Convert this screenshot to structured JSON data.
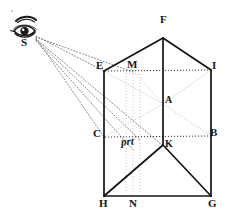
{
  "figure": {
    "kind": "geometric-optics-perspective-diagram",
    "style": "antique engraving line drawing",
    "background_color": "#ffffff",
    "ink_color": "#151515",
    "observer": {
      "icon": "eye-icon",
      "label": "S",
      "label_x": 26,
      "label_y": 43,
      "eye_center_x": 26,
      "eye_center_y": 31
    },
    "vertex_labels": [
      {
        "id": "F",
        "text": "F",
        "x": 160,
        "y": 14
      },
      {
        "id": "E",
        "text": "E",
        "x": 99,
        "y": 63
      },
      {
        "id": "M",
        "text": "M",
        "x": 130,
        "y": 62
      },
      {
        "id": "I",
        "text": "I",
        "x": 212,
        "y": 63
      },
      {
        "id": "A",
        "text": "A",
        "x": 165,
        "y": 94
      },
      {
        "id": "C",
        "text": "C",
        "x": 96,
        "y": 130
      },
      {
        "id": "B",
        "text": "B",
        "x": 211,
        "y": 129
      },
      {
        "id": "K",
        "text": "K",
        "x": 164,
        "y": 140
      },
      {
        "id": "H",
        "text": "H",
        "x": 100,
        "y": 200
      },
      {
        "id": "N",
        "text": "N",
        "x": 130,
        "y": 200
      },
      {
        "id": "G",
        "text": "G",
        "x": 209,
        "y": 200
      }
    ],
    "point_labels": [
      {
        "id": "prt",
        "text": "prt",
        "x": 122,
        "y": 139
      }
    ],
    "geometry": {
      "points": {
        "F": [
          163,
          38
        ],
        "E": [
          104,
          71
        ],
        "I": [
          211,
          70
        ],
        "M": [
          133,
          71
        ],
        "A": [
          163,
          104
        ],
        "C": [
          104,
          137
        ],
        "B": [
          211,
          136
        ],
        "K": [
          163,
          145
        ],
        "H": [
          104,
          196
        ],
        "N": [
          133,
          196
        ],
        "G": [
          211,
          196
        ],
        "S": [
          34,
          36
        ]
      },
      "solid_edges": [
        [
          "E",
          "F"
        ],
        [
          "F",
          "I"
        ],
        [
          "F",
          "K"
        ],
        [
          "E",
          "C"
        ],
        [
          "C",
          "H"
        ],
        [
          "I",
          "B"
        ],
        [
          "B",
          "G"
        ],
        [
          "H",
          "G"
        ],
        [
          "H",
          "K"
        ],
        [
          "K",
          "G"
        ]
      ],
      "dotted_edges": [
        [
          "E",
          "I"
        ],
        [
          "C",
          "B"
        ],
        [
          "M",
          "N"
        ]
      ],
      "faint_dotted_edges": [
        [
          "M",
          "A"
        ],
        [
          "E",
          "A"
        ],
        [
          "A",
          "I"
        ],
        [
          "A",
          "B"
        ],
        [
          "A",
          "C"
        ]
      ],
      "sight_rays_from_S": [
        "E",
        "M",
        "C",
        "K",
        "N"
      ]
    }
  }
}
